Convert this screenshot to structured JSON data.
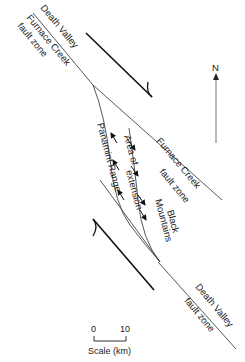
{
  "figure": {
    "labels": {
      "death_valley_top": "Death Valley",
      "furnace_creek_top": "Furnace Creek",
      "fault_zone_top": "fault zone",
      "furnace_creek_mid": "Furnace Creek",
      "fault_zone_mid": "fault zone",
      "panamint_range": "Panamint Range",
      "area_of": "Area of",
      "extension": "extension",
      "black": "Black",
      "mountains": "Mountains",
      "death_valley_bottom": "Death Valley",
      "fault_zone_bottom": "fault zone"
    },
    "north_arrow": {
      "label": "N"
    },
    "scale_bar": {
      "start": "0",
      "end": "10",
      "caption": "Scale (km)"
    },
    "colors": {
      "line": "#333333",
      "arrow": "#111111",
      "background": "#ffffff"
    }
  }
}
